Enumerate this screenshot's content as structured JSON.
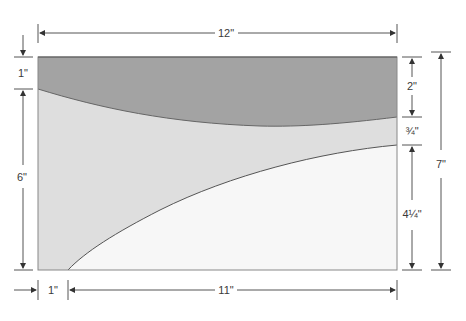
{
  "diagram": {
    "colors": {
      "top_band": "#a3a3a3",
      "middle_band": "#dedede",
      "bottom_region": "#f7f7f7",
      "outline": "#666666",
      "dimension_line": "#555555",
      "label_text": "#3a3a3a"
    },
    "regions": [
      {
        "name": "top-band",
        "shade": "dark gray"
      },
      {
        "name": "middle-band",
        "shade": "light gray"
      },
      {
        "name": "bottom-region",
        "shade": "near white"
      }
    ],
    "dimensions": {
      "overall_width": "12\"",
      "overall_height": "7\"",
      "left_top_offset": "1\"",
      "left_band_height": "6\"",
      "right_top_band": "2\"",
      "right_middle_band": "¾\"",
      "right_bottom_region": "4¼\"",
      "bottom_left_offset": "1\"",
      "bottom_curve_span": "11\""
    }
  }
}
